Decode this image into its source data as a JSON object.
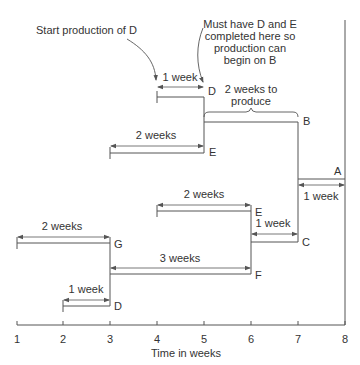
{
  "annotations": {
    "start_note": "Start production of D",
    "must_have_note": [
      "Must have D and E",
      "completed here so",
      "production can",
      "begin on B"
    ],
    "b_duration_note": [
      "2 weeks to",
      "produce"
    ]
  },
  "axis": {
    "label": "Time in weeks",
    "ticks": [
      "1",
      "2",
      "3",
      "4",
      "5",
      "6",
      "7",
      "8"
    ]
  },
  "bars": [
    {
      "item": "D",
      "start": 4,
      "end": 5,
      "duration_label": "1 week"
    },
    {
      "item": "B",
      "start": 5,
      "end": 7,
      "duration_label": ""
    },
    {
      "item": "E",
      "start": 3,
      "end": 5,
      "duration_label": "2 weeks"
    },
    {
      "item": "A",
      "start": 7,
      "end": 8,
      "duration_label": "1 week"
    },
    {
      "item": "E",
      "start": 4,
      "end": 6,
      "duration_label": "2 weeks"
    },
    {
      "item": "C",
      "start": 6,
      "end": 7,
      "duration_label": "1 week"
    },
    {
      "item": "G",
      "start": 1,
      "end": 3,
      "duration_label": "2 weeks"
    },
    {
      "item": "F",
      "start": 3,
      "end": 6,
      "duration_label": "3 weeks"
    },
    {
      "item": "D",
      "start": 2,
      "end": 3,
      "duration_label": "1 week"
    }
  ],
  "colors": {
    "line": "#555555",
    "text": "#333333",
    "background": "#ffffff"
  }
}
